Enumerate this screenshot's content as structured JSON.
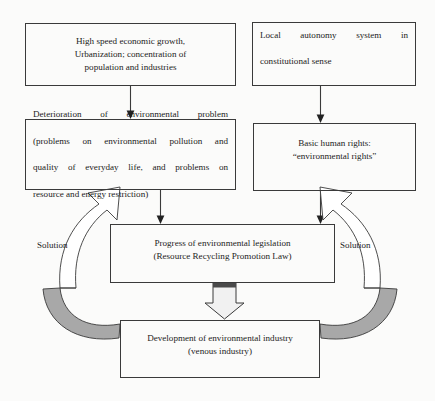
{
  "diagram": {
    "background_color": "#fbfbfa",
    "stroke_color": "#3a3a3a",
    "gray_fill": "#a8a8a8",
    "nodes": {
      "growth": {
        "lines": [
          "High speed economic growth,",
          "Urbanization; concentration of",
          "population and industries"
        ]
      },
      "autonomy": {
        "lines": [
          "Local autonomy system in",
          "constitutional sense"
        ]
      },
      "deterioration": {
        "lines": [
          "Deterioration of environmental problem",
          "(problems on environmental pollution and",
          "quality of everyday life, and problems on",
          "resource and energy restriction)"
        ]
      },
      "rights": {
        "lines": [
          "Basic human rights:",
          "“environmental rights”"
        ]
      },
      "legislation": {
        "lines": [
          "Progress of environmental legislation",
          "(Resource Recycling Promotion Law)"
        ]
      },
      "industry": {
        "lines": [
          "Development of environmental industry",
          "(venous industry)"
        ]
      }
    },
    "labels": {
      "solution_left": "Solution",
      "solution_right": "Solution"
    },
    "connectors": [
      {
        "name": "growth-to-deterioration",
        "type": "thin-arrow",
        "direction": "down"
      },
      {
        "name": "autonomy-to-rights",
        "type": "thin-arrow",
        "direction": "down"
      },
      {
        "name": "deterioration-to-legislation",
        "type": "thin-arrow",
        "direction": "down"
      },
      {
        "name": "rights-to-legislation",
        "type": "thin-arrow",
        "direction": "down"
      },
      {
        "name": "legislation-to-industry",
        "type": "block-arrow",
        "direction": "down"
      },
      {
        "name": "industry-to-deterioration",
        "type": "curved-block-arrow",
        "direction": "counter-clockwise"
      },
      {
        "name": "industry-to-rights",
        "type": "curved-block-arrow",
        "direction": "clockwise"
      }
    ]
  }
}
